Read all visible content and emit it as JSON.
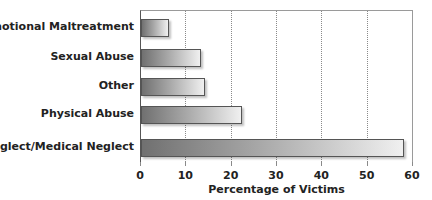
{
  "chart_data": {
    "type": "bar",
    "orientation": "horizontal",
    "title": "",
    "categories": [
      "Emotional Maltreatment",
      "Sexual Abuse",
      "Other",
      "Physical Abuse",
      "Neglect/Medical Neglect"
    ],
    "values": [
      6.2,
      13.2,
      14.2,
      22.2,
      58.0
    ],
    "xlabel": "Percentage of Victims",
    "ylabel": "",
    "xlim": [
      0,
      60
    ],
    "xticks": [
      "0",
      "10",
      "20",
      "30",
      "40",
      "50",
      "60"
    ],
    "grid": "vertical dotted at 10-unit intervals",
    "legend": null,
    "bar_style": "gray-to-white horizontal gradient with dark border"
  },
  "colors": {
    "bar_dark": "#707070",
    "bar_light": "#f0f0f0",
    "bar_border": "#555555",
    "gridline": "#8a8a8a",
    "text": "#222222"
  }
}
